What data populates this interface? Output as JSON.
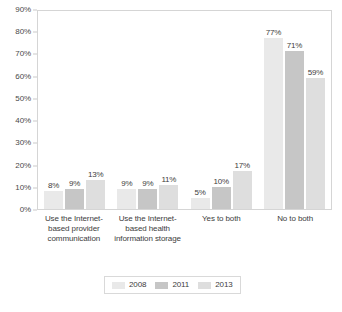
{
  "chart_data": {
    "type": "bar",
    "title": "",
    "subtitle": "",
    "xlabel": "",
    "ylabel": "",
    "ylim": [
      0,
      90
    ],
    "ytick_step": 10,
    "grid": false,
    "legend_position": "bottom-center",
    "categories": [
      "Use the Internet-based provider communication",
      "Use the Internet-based health information storage",
      "Yes to both",
      "No to both"
    ],
    "series": [
      {
        "name": "2008",
        "color": "#e9e9e9",
        "values": [
          8,
          9,
          5,
          77
        ]
      },
      {
        "name": "2011",
        "color": "#c6c6c6",
        "values": [
          9,
          9,
          10,
          71
        ]
      },
      {
        "name": "2013",
        "color": "#dedede",
        "values": [
          13,
          11,
          17,
          59
        ]
      }
    ],
    "value_labels": [
      [
        "8%",
        "9%",
        "13%"
      ],
      [
        "9%",
        "9%",
        "11%"
      ],
      [
        "5%",
        "10%",
        "17%"
      ],
      [
        "77%",
        "71%",
        "59%"
      ]
    ],
    "ytick_labels": [
      "90%",
      "80%",
      "70%",
      "60%",
      "50%",
      "40%",
      "30%",
      "20%",
      "10%",
      "0%"
    ]
  },
  "axis": {
    "y_ticks": [
      {
        "label": "90%",
        "value": 90
      },
      {
        "label": "80%",
        "value": 80
      },
      {
        "label": "70%",
        "value": 70
      },
      {
        "label": "60%",
        "value": 60
      },
      {
        "label": "50%",
        "value": 50
      },
      {
        "label": "40%",
        "value": 40
      },
      {
        "label": "30%",
        "value": 30
      },
      {
        "label": "20%",
        "value": 20
      },
      {
        "label": "10%",
        "value": 10
      },
      {
        "label": "0%",
        "value": 0
      }
    ]
  },
  "groups": [
    {
      "label": "Use the Internet-based provider communication",
      "bars": [
        {
          "series": "2008",
          "value": 8,
          "label": "8%"
        },
        {
          "series": "2011",
          "value": 9,
          "label": "9%"
        },
        {
          "series": "2013",
          "value": 13,
          "label": "13%"
        }
      ]
    },
    {
      "label": "Use the Internet-based health information storage",
      "bars": [
        {
          "series": "2008",
          "value": 9,
          "label": "9%"
        },
        {
          "series": "2011",
          "value": 9,
          "label": "9%"
        },
        {
          "series": "2013",
          "value": 11,
          "label": "11%"
        }
      ]
    },
    {
      "label": "Yes to both",
      "bars": [
        {
          "series": "2008",
          "value": 5,
          "label": "5%"
        },
        {
          "series": "2011",
          "value": 10,
          "label": "10%"
        },
        {
          "series": "2013",
          "value": 17,
          "label": "17%"
        }
      ]
    },
    {
      "label": "No to both",
      "bars": [
        {
          "series": "2008",
          "value": 77,
          "label": "77%"
        },
        {
          "series": "2011",
          "value": 71,
          "label": "71%"
        },
        {
          "series": "2013",
          "value": 59,
          "label": "59%"
        }
      ]
    }
  ],
  "legend": {
    "items": [
      {
        "label": "2008",
        "color": "#e9e9e9"
      },
      {
        "label": "2011",
        "color": "#c6c6c6"
      },
      {
        "label": "2013",
        "color": "#dedede"
      }
    ]
  },
  "colors": {
    "series_2008": "#e9e9e9",
    "series_2011": "#c6c6c6",
    "series_2013": "#dedede",
    "plot_border": "#d5d5d5",
    "text": "#3d3d3d"
  }
}
